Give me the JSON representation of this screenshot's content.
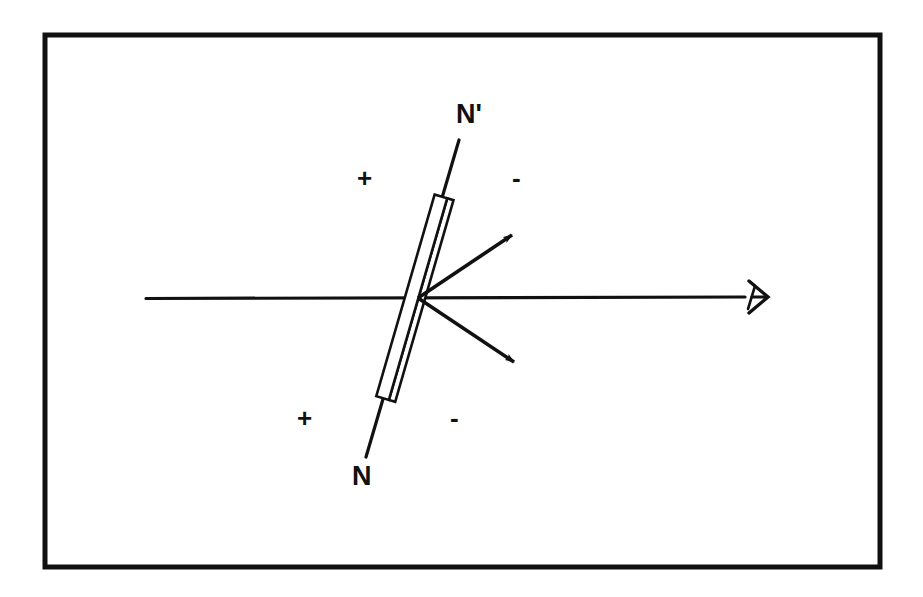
{
  "figure": {
    "background_color": "#ffffff",
    "ink_color": "#111111",
    "border": {
      "name": "figure-frame",
      "x": 45,
      "y": 35,
      "width": 835,
      "height": 532,
      "stroke_width": 5
    },
    "labels": {
      "north_prime": "N'",
      "north": "N",
      "axis_right": "A",
      "plus_upper_left": "+",
      "minus_upper_right": "-",
      "plus_lower_left": "+",
      "minus_lower_right": "-"
    },
    "geometry": {
      "center": {
        "x": 418,
        "y": 298
      },
      "horizontal_axis": {
        "x1": 146,
        "y1": 298,
        "x2": 745,
        "y2": 297
      },
      "needle_axis": {
        "x1": 459,
        "y1": 140,
        "x2": 366,
        "y2": 457
      },
      "needle_bar": {
        "top": {
          "x": 441,
          "y": 200
        },
        "bottom": {
          "x": 389,
          "y": 400
        },
        "width": 13
      },
      "arrow_upper": {
        "x1": 418,
        "y1": 298,
        "x2": 518,
        "y2": 231
      },
      "arrow_lower": {
        "x1": 418,
        "y1": 298,
        "x2": 521,
        "y2": 366
      }
    },
    "label_positions": {
      "north_prime": {
        "x": 456,
        "y": 101
      },
      "north": {
        "x": 352,
        "y": 463
      },
      "axis_right": {
        "x": 744,
        "y": 281
      },
      "plus_upper_left": {
        "x": 357,
        "y": 165
      },
      "minus_upper_right": {
        "x": 512,
        "y": 165
      },
      "plus_lower_left": {
        "x": 297,
        "y": 405
      },
      "minus_lower_right": {
        "x": 450,
        "y": 405
      }
    }
  }
}
